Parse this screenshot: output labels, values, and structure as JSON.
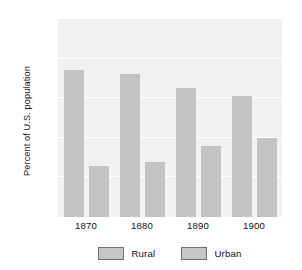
{
  "chart_data": {
    "type": "bar",
    "title": "",
    "subtitle": "",
    "xlabel": "",
    "ylabel": "Percent of U.S. population",
    "categories": [
      "1870",
      "1880",
      "1890",
      "1900"
    ],
    "series": [
      {
        "name": "Rural",
        "values": [
          74,
          72,
          65,
          61
        ],
        "color": "#c3c3c3"
      },
      {
        "name": "Urban",
        "values": [
          26,
          28,
          36,
          40
        ],
        "color": "#c3c3c3"
      }
    ],
    "ylim": [
      0,
      100
    ],
    "yticks": [
      20,
      40,
      60,
      80,
      100
    ],
    "ytick_labels": [
      "20",
      "40",
      "60",
      "80",
      "100"
    ],
    "grid": true,
    "gridline_color": "#ffffff",
    "plot_background": "#f1f1f1",
    "legend_position": "bottom",
    "legend_entries": [
      "Rural",
      "Urban"
    ],
    "annotations": []
  },
  "axes": {
    "y_title": "Percent of U.S. population"
  },
  "legend": {
    "items": [
      {
        "label": "Rural",
        "swatch_color": "#c6c6c6",
        "swatch_border": "#6f6f6f"
      },
      {
        "label": "Urban",
        "swatch_color": "#c6c6c6",
        "swatch_border": "#6f6f6f"
      }
    ]
  }
}
